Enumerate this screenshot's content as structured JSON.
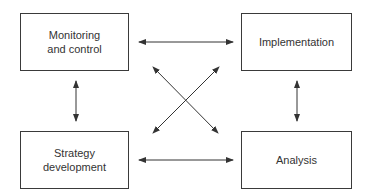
{
  "diagram": {
    "nodes": [
      {
        "id": "monitoring",
        "label": "Monitoring\nand control"
      },
      {
        "id": "implementation",
        "label": "Implementation"
      },
      {
        "id": "strategy",
        "label": "Strategy\ndevelopment"
      },
      {
        "id": "analysis",
        "label": "Analysis"
      }
    ],
    "edges": [
      {
        "from": "monitoring",
        "to": "implementation",
        "type": "bidirectional"
      },
      {
        "from": "strategy",
        "to": "analysis",
        "type": "bidirectional"
      },
      {
        "from": "monitoring",
        "to": "strategy",
        "type": "bidirectional"
      },
      {
        "from": "implementation",
        "to": "analysis",
        "type": "bidirectional"
      },
      {
        "from": "monitoring",
        "to": "analysis",
        "type": "bidirectional"
      },
      {
        "from": "implementation",
        "to": "strategy",
        "type": "bidirectional"
      }
    ],
    "colors": {
      "line": "#333333",
      "text": "#333333",
      "background": "#ffffff"
    }
  }
}
